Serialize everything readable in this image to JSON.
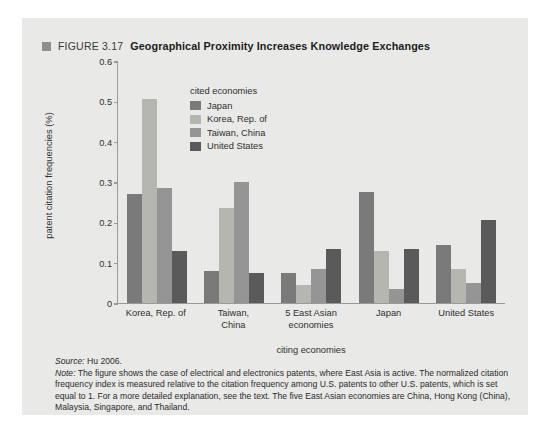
{
  "figure": {
    "marker_icon": "square-marker-icon",
    "number": "FIGURE 3.17",
    "title": "Geographical Proximity Increases Knowledge Exchanges"
  },
  "legend": {
    "title": "cited economies",
    "position": "inside-top-left",
    "items": [
      {
        "label": "Japan",
        "color": "#7a7a7a"
      },
      {
        "label": "Korea, Rep. of",
        "color": "#b6b6b0"
      },
      {
        "label": "Taiwan, China",
        "color": "#959595"
      },
      {
        "label": "United States",
        "color": "#5a5a5a"
      }
    ]
  },
  "notes": {
    "source_lead": "Source:",
    "source_text": " Hu 2006.",
    "note_lead": "Note:",
    "note_text": " The figure shows the case of electrical and electronics patents, where East Asia is active. The normalized citation frequency index is measured relative to the citation frequency among U.S. patents to other U.S. patents, which is set equal to 1. For a more detailed explanation, see the text. The five East Asian economies are China, Hong Kong (China), Malaysia, Singapore, and Thailand."
  },
  "chart_data": {
    "type": "bar",
    "title": "Geographical Proximity Increases Knowledge Exchanges",
    "xlabel": "citing economies",
    "ylabel": "patent citation frequencies (%)",
    "ylim": [
      0,
      0.6
    ],
    "yticks": [
      "0",
      "0.1",
      "0.2",
      "0.3",
      "0.4",
      "0.5",
      "0.6"
    ],
    "ytick_values": [
      0,
      0.1,
      0.2,
      0.3,
      0.4,
      0.5,
      0.6
    ],
    "grid": false,
    "legend_position": "inside-top-left",
    "categories": [
      "Korea, Rep. of",
      "Taiwan, China",
      "5 East Asian economies",
      "Japan",
      "United States"
    ],
    "category_lines": [
      [
        "Korea, Rep. of"
      ],
      [
        "Taiwan,",
        "China"
      ],
      [
        "5 East Asian",
        "economies"
      ],
      [
        "Japan"
      ],
      [
        "United States"
      ]
    ],
    "series": [
      {
        "name": "Japan",
        "color": "#7a7a7a",
        "values": [
          0.27,
          0.08,
          0.075,
          0.275,
          0.145
        ]
      },
      {
        "name": "Korea, Rep. of",
        "color": "#b6b6b0",
        "values": [
          0.505,
          0.235,
          0.045,
          0.13,
          0.085
        ]
      },
      {
        "name": "Taiwan, China",
        "color": "#959595",
        "values": [
          0.285,
          0.3,
          0.085,
          0.035,
          0.05
        ]
      },
      {
        "name": "United States",
        "color": "#5a5a5a",
        "values": [
          0.13,
          0.075,
          0.135,
          0.135,
          0.205
        ]
      }
    ]
  }
}
